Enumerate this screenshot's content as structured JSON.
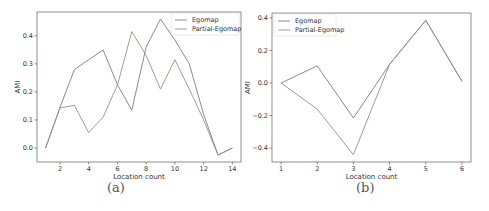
{
  "chart_data": [
    {
      "type": "line",
      "panel": "a",
      "caption": "(a)",
      "title": "",
      "xlabel": "Location count",
      "ylabel": "AMI",
      "xlim": [
        0.4,
        14.6
      ],
      "ylim": [
        -0.05,
        0.485
      ],
      "x": [
        1,
        2,
        3,
        4,
        5,
        6,
        7,
        8,
        9,
        10,
        11,
        12,
        13,
        14
      ],
      "xticks": [
        2,
        4,
        6,
        8,
        10,
        12,
        14
      ],
      "yticks": [
        0.0,
        0.1,
        0.2,
        0.3,
        0.4
      ],
      "ytick_labels": [
        "0.0",
        "0.1",
        "0.2",
        "0.3",
        "0.4"
      ],
      "grid": false,
      "legend_position": "upper right",
      "series": [
        {
          "name": "Egomap",
          "color": "#7a7a8c",
          "values": [
            0.0,
            0.145,
            0.28,
            0.315,
            0.35,
            0.225,
            0.135,
            0.36,
            0.46,
            0.385,
            0.3,
            0.12,
            -0.025,
            0.0
          ]
        },
        {
          "name": "Partial-Egomap",
          "color": "#9a9088",
          "values": [
            0.0,
            0.143,
            0.152,
            0.055,
            0.11,
            0.225,
            0.415,
            0.33,
            0.21,
            0.315,
            0.21,
            0.1,
            -0.025,
            0.0
          ]
        }
      ]
    },
    {
      "type": "line",
      "panel": "b",
      "caption": "(b)",
      "title": "",
      "xlabel": "Location count",
      "ylabel": "AMI",
      "xlim": [
        0.75,
        6.25
      ],
      "ylim": [
        -0.485,
        0.43
      ],
      "x": [
        1,
        2,
        3,
        4,
        5,
        6
      ],
      "xticks": [
        1,
        2,
        3,
        4,
        5,
        6
      ],
      "yticks": [
        -0.4,
        -0.2,
        0.0,
        0.2,
        0.4
      ],
      "ytick_labels": [
        "−0.4",
        "−0.2",
        "0.0",
        "0.2",
        "0.4"
      ],
      "grid": false,
      "legend_position": "upper left",
      "series": [
        {
          "name": "Egomap",
          "color": "#7a7a8c",
          "values": [
            0.0,
            0.105,
            -0.215,
            0.115,
            0.385,
            0.01
          ]
        },
        {
          "name": "Partial-Egomap",
          "color": "#9a9088",
          "values": [
            0.0,
            -0.16,
            -0.44,
            0.115,
            0.385,
            0.01
          ]
        }
      ]
    }
  ]
}
